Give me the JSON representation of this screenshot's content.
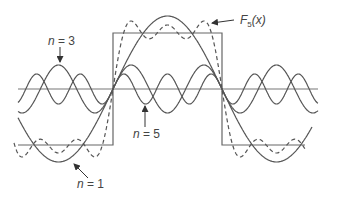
{
  "figure": {
    "colors": {
      "stroke": "#555555",
      "axis": "#777777",
      "text": "#444444",
      "background": "#ffffff"
    },
    "axis": {
      "y": 89,
      "x_start": 18,
      "x_end": 318
    },
    "square_wave": {
      "high_y": 33,
      "low_y": 145,
      "rise_x": 113,
      "fall_x": 222,
      "x_start": 18,
      "x_end": 305
    },
    "harmonic_geometry": {
      "zero_x": 113,
      "half_period_px": 109,
      "x_min": 18,
      "x_max": 318
    },
    "curves": [
      {
        "id": "n1",
        "n": 1,
        "amplitude_px": 73,
        "style": "solid",
        "x_min": 18,
        "x_max": 312
      },
      {
        "id": "n3",
        "n": 3,
        "amplitude_px": 24,
        "style": "solid",
        "x_min": 18,
        "x_max": 318
      },
      {
        "id": "n5",
        "n": 5,
        "amplitude_px": 15,
        "style": "solid",
        "x_min": 18,
        "x_max": 318
      },
      {
        "id": "F5",
        "n": "sum",
        "terms": [
          1,
          3,
          5
        ],
        "style": "dashed",
        "x_min": 14,
        "x_max": 306
      }
    ]
  },
  "labels": {
    "n3": {
      "prefix": "n",
      "text": " = 3",
      "x": 48,
      "y": 35
    },
    "n5": {
      "prefix": "n",
      "text": " = 5",
      "x": 133,
      "y": 128
    },
    "n1": {
      "prefix": "n",
      "text": " = 1",
      "x": 77,
      "y": 178
    },
    "f5": {
      "prefix": "F",
      "subscript": "5",
      "text": "(x)",
      "x": 240,
      "y": 14
    }
  },
  "arrows": [
    {
      "name": "n3-arrow",
      "x1": 60,
      "y1": 47,
      "x2": 60,
      "y2": 62
    },
    {
      "name": "n5-arrow",
      "x1": 145,
      "y1": 127,
      "x2": 145,
      "y2": 106
    },
    {
      "name": "n1-arrow",
      "x1": 88,
      "y1": 178,
      "x2": 74,
      "y2": 164
    },
    {
      "name": "f5-arrow",
      "x1": 234,
      "y1": 20,
      "x2": 212,
      "y2": 23
    }
  ]
}
